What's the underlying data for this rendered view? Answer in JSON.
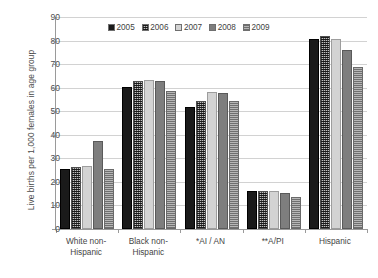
{
  "chart_data": {
    "type": "bar",
    "title": "",
    "xlabel": "",
    "ylabel": "Live births per 1,000 females in age group",
    "ylim": [
      0,
      90
    ],
    "yticks": [
      0,
      10,
      20,
      30,
      40,
      50,
      60,
      70,
      80,
      90
    ],
    "grid": true,
    "legend_position": "top-center",
    "categories": [
      "White non-Hispanic",
      "Black non-Hispanic",
      "*AI / AN",
      "**A/PI",
      "Hispanic"
    ],
    "series": [
      {
        "name": "2005",
        "values": [
          25.5,
          60.5,
          52.0,
          16.0,
          80.8
        ]
      },
      {
        "name": "2006",
        "values": [
          26.5,
          63.0,
          54.2,
          16.0,
          81.8
        ]
      },
      {
        "name": "2007",
        "values": [
          26.6,
          63.3,
          58.0,
          16.0,
          80.7
        ]
      },
      {
        "name": "2008",
        "values": [
          37.4,
          62.8,
          57.9,
          15.1,
          76.1
        ]
      },
      {
        "name": "2009",
        "values": [
          25.4,
          58.5,
          54.5,
          13.5,
          68.9
        ]
      }
    ]
  },
  "legend": {
    "items": [
      {
        "label": "2005",
        "swatch": "legend-swatch-2005"
      },
      {
        "label": "2006",
        "swatch": "legend-swatch-2006"
      },
      {
        "label": "2007",
        "swatch": "legend-swatch-2007"
      },
      {
        "label": "2008",
        "swatch": "legend-swatch-2008"
      },
      {
        "label": "2009",
        "swatch": "legend-swatch-2009"
      }
    ]
  },
  "axis": {
    "y_title": "Live births per 1,000 females in age group",
    "y_tick_labels": [
      "90",
      "80",
      "70",
      "60",
      "50",
      "40",
      "30",
      "20",
      "10",
      "0"
    ],
    "x_tick_labels": [
      "White non-\nHispanic",
      "Black non-\nHispanic",
      "*AI / AN",
      "**A/PI",
      "Hispanic"
    ]
  }
}
